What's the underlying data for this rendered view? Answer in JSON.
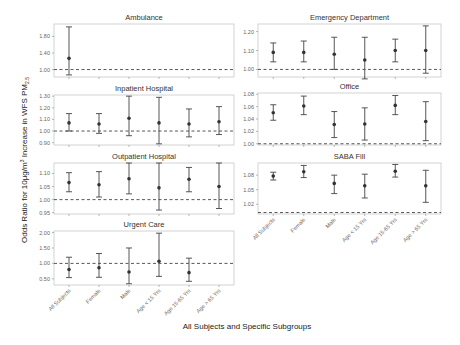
{
  "chart_data": {
    "type": "scatter",
    "subtype": "forest-plot-faceted",
    "xlabel": "All Subjects and Specific Subgroups",
    "ylabel": "Odds Ratio for 10μg/m³ Increase in WFS PM2.5",
    "ylabel_parts": {
      "main": "Odds Ratio for 10μg/m",
      "sup": "3",
      "mid": " Increase in WFS PM",
      "sub": "2.5"
    },
    "categories": [
      "All Subjects",
      "Female",
      "Male",
      "Age < 15 Yrs",
      "Age 15-65 Yrs",
      "Age > 65 Yrs"
    ],
    "reference_line": 1.0,
    "panels": [
      {
        "title": "Ambulance",
        "box": [
          54,
          24,
          234,
          77
        ],
        "ylim": [
          0.82,
          2.1
        ],
        "yticks": [
          1.0,
          1.4,
          1.8
        ],
        "ytick_labels": [
          "1.00",
          "1.40",
          "1.80"
        ],
        "estimates": [
          1.27,
          null,
          null,
          null,
          null,
          null
        ],
        "lower": [
          0.87,
          null,
          null,
          null,
          null,
          null
        ],
        "upper": [
          2.03,
          null,
          null,
          null,
          null,
          null
        ],
        "show_xlabels": false
      },
      {
        "title": "Emergency Department",
        "box": [
          258,
          24,
          441,
          77
        ],
        "ylim": [
          0.96,
          1.24
        ],
        "yticks": [
          1.0,
          1.1,
          1.2
        ],
        "ytick_labels": [
          "1.00",
          "1.10",
          "1.20"
        ],
        "estimates": [
          1.09,
          1.09,
          1.08,
          1.05,
          1.1,
          1.1
        ],
        "lower": [
          1.04,
          1.04,
          1.0,
          0.95,
          1.04,
          0.98
        ],
        "upper": [
          1.14,
          1.15,
          1.17,
          1.17,
          1.16,
          1.23
        ],
        "show_xlabels": false
      },
      {
        "title": "Inpatient Hospital",
        "box": [
          54,
          95,
          234,
          145
        ],
        "ylim": [
          0.88,
          1.31
        ],
        "yticks": [
          0.9,
          1.0,
          1.1,
          1.2,
          1.3
        ],
        "ytick_labels": [
          "0.90",
          "1.00",
          "1.10",
          "1.20",
          "1.30"
        ],
        "estimates": [
          1.07,
          1.06,
          1.11,
          1.07,
          1.06,
          1.08
        ],
        "lower": [
          1.0,
          0.98,
          0.96,
          0.89,
          0.95,
          0.97
        ],
        "upper": [
          1.15,
          1.15,
          1.3,
          1.29,
          1.19,
          1.21
        ],
        "show_xlabels": false
      },
      {
        "title": "Office",
        "box": [
          258,
          93,
          441,
          145
        ],
        "ylim": [
          0.998,
          1.082
        ],
        "yticks": [
          1.0,
          1.02,
          1.04,
          1.06,
          1.08
        ],
        "ytick_labels": [
          "1.00",
          "1.02",
          "1.04",
          "1.06",
          "1.08"
        ],
        "estimates": [
          1.05,
          1.061,
          1.031,
          1.032,
          1.062,
          1.036
        ],
        "lower": [
          1.038,
          1.047,
          1.01,
          1.006,
          1.047,
          1.005
        ],
        "upper": [
          1.063,
          1.077,
          1.052,
          1.058,
          1.078,
          1.068
        ],
        "show_xlabels": false
      },
      {
        "title": "Outpatient Hospital",
        "box": [
          54,
          163,
          234,
          214
        ],
        "ylim": [
          0.945,
          1.14
        ],
        "yticks": [
          0.95,
          1.0,
          1.05,
          1.1
        ],
        "ytick_labels": [
          "0.95",
          "1.00",
          "1.05",
          "1.10"
        ],
        "estimates": [
          1.065,
          1.057,
          1.08,
          1.045,
          1.078,
          1.05
        ],
        "lower": [
          1.03,
          1.01,
          1.022,
          0.96,
          1.03,
          0.966
        ],
        "upper": [
          1.103,
          1.107,
          1.14,
          1.14,
          1.123,
          1.14
        ],
        "show_xlabels": false
      },
      {
        "title": "SABA Fill",
        "box": [
          258,
          163,
          441,
          214
        ],
        "ylim": [
          1.0,
          1.105
        ],
        "yticks": [
          1.02,
          1.05,
          1.08
        ],
        "ytick_labels": [
          "1.02",
          "1.05",
          "1.08"
        ],
        "estimates": [
          1.078,
          1.087,
          1.063,
          1.058,
          1.088,
          1.058
        ],
        "lower": [
          1.07,
          1.075,
          1.042,
          1.033,
          1.076,
          1.024
        ],
        "upper": [
          1.086,
          1.1,
          1.08,
          1.082,
          1.102,
          1.09
        ],
        "ref_value": 1.0,
        "show_xlabels": true
      },
      {
        "title": "Urgent Care",
        "box": [
          54,
          231,
          234,
          285
        ],
        "ylim": [
          0.3,
          2.05
        ],
        "yticks": [
          0.5,
          1.0,
          1.5,
          2.0
        ],
        "ytick_labels": [
          "0.50",
          "1.00",
          "1.50",
          "2.00"
        ],
        "estimates": [
          0.8,
          0.86,
          0.72,
          1.07,
          0.7,
          null
        ],
        "lower": [
          0.54,
          0.55,
          0.34,
          0.58,
          0.42,
          null
        ],
        "upper": [
          1.2,
          1.32,
          1.5,
          1.98,
          1.17,
          null
        ],
        "show_xlabels": true
      }
    ],
    "grid": false,
    "legend": null
  }
}
